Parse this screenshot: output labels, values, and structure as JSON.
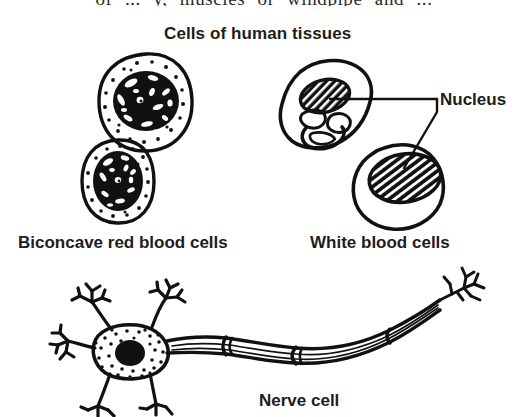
{
  "figure": {
    "title": "Cells of human tissues",
    "cutoff_header_text": "of ... y, muscles or windpipe and ...",
    "background_color": "#ffffff",
    "ink_color": "#111111",
    "labels": {
      "nucleus": "Nucleus",
      "red_blood_cells": "Biconcave red blood cells",
      "white_blood_cells": "White blood cells",
      "nerve_cell": "Nerve cell"
    },
    "parts": [
      {
        "name": "red-blood-cell-upper",
        "type": "cell",
        "description": "stippled ring with dark mottled centre"
      },
      {
        "name": "red-blood-cell-lower",
        "type": "cell",
        "description": "stippled ring with dark mottled centre"
      },
      {
        "name": "white-blood-cell-upper",
        "type": "cell",
        "description": "irregular outline with lobed hatched nucleus"
      },
      {
        "name": "white-blood-cell-lower",
        "type": "cell",
        "description": "irregular outline with large hatched oval nucleus"
      },
      {
        "name": "nerve-cell",
        "type": "cell",
        "description": "neuron with dendrites, stippled cell body, dark nucleus, myelinated axon and terminal branches"
      }
    ]
  }
}
